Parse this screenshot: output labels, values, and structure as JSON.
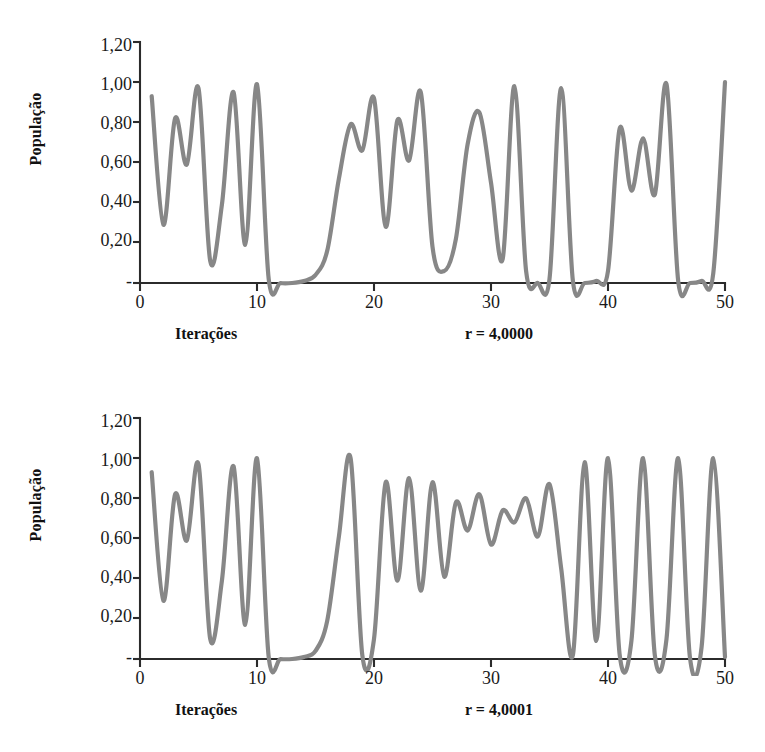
{
  "page": {
    "background_color": "#ffffff",
    "line_color": "#878787",
    "axis_color": "#2b2b2b"
  },
  "figures": [
    {
      "id": "figure-1",
      "ylabel": "População",
      "xlabel": "Iterações",
      "param_label": "r = 4,0000",
      "y_ticks": [
        "1,20",
        "1,00",
        "0,80",
        "0,60",
        "0,40",
        "0,20",
        "-"
      ],
      "x_ticks": [
        "0",
        "10",
        "20",
        "30",
        "40",
        "50"
      ]
    },
    {
      "id": "figure-2",
      "ylabel": "População",
      "xlabel": "Iterações",
      "param_label": "r = 4,0001",
      "y_ticks": [
        "1,20",
        "1,00",
        "0,80",
        "0,60",
        "0,40",
        "0,20",
        "-"
      ],
      "x_ticks": [
        "0",
        "10",
        "20",
        "30",
        "40",
        "50"
      ]
    }
  ],
  "chart_data": [
    {
      "type": "line",
      "title": "",
      "subtitle": "",
      "xlabel": "Iterações",
      "ylabel": "População",
      "annotation": "r = 4,0000",
      "xlim": [
        0,
        50
      ],
      "ylim": [
        0,
        1.2
      ],
      "yticks": [
        0,
        0.2,
        0.4,
        0.6,
        0.8,
        1.0,
        1.2
      ],
      "ytick_labels": [
        "-",
        "0,20",
        "0,40",
        "0,60",
        "0,80",
        "1,00",
        "1,20"
      ],
      "xticks": [
        0,
        10,
        20,
        30,
        40,
        50
      ],
      "xtick_labels": [
        "0",
        "10",
        "20",
        "30",
        "40",
        "50"
      ],
      "grid": false,
      "legend": false,
      "series": [
        {
          "name": "r = 4,0000",
          "x": [
            1,
            2,
            3,
            4,
            5,
            6,
            7,
            8,
            9,
            10,
            11,
            12,
            13,
            14,
            15,
            16,
            17,
            18,
            19,
            20,
            21,
            22,
            23,
            24,
            25,
            26,
            27,
            28,
            29,
            30,
            31,
            32,
            33,
            34,
            35,
            36,
            37,
            38,
            39,
            40,
            41,
            42,
            43,
            44,
            45,
            46,
            47,
            48,
            49,
            50
          ],
          "values": [
            0.93,
            0.29,
            0.82,
            0.59,
            0.97,
            0.11,
            0.39,
            0.95,
            0.19,
            0.99,
            0.02,
            0.0,
            0.0,
            0.01,
            0.04,
            0.16,
            0.52,
            0.79,
            0.66,
            0.92,
            0.28,
            0.81,
            0.61,
            0.95,
            0.18,
            0.06,
            0.22,
            0.69,
            0.85,
            0.5,
            0.12,
            0.98,
            0.06,
            0.0,
            0.02,
            0.97,
            0.01,
            0.0,
            0.01,
            0.06,
            0.77,
            0.46,
            0.72,
            0.44,
            0.99,
            0.01,
            0.0,
            0.01,
            0.05,
            1.0
          ]
        }
      ]
    },
    {
      "type": "line",
      "title": "",
      "subtitle": "",
      "xlabel": "Iterações",
      "ylabel": "População",
      "annotation": "r = 4,0001",
      "xlim": [
        0,
        50
      ],
      "ylim": [
        0,
        1.2
      ],
      "yticks": [
        0,
        0.2,
        0.4,
        0.6,
        0.8,
        1.0,
        1.2
      ],
      "ytick_labels": [
        "-",
        "0,20",
        "0,40",
        "0,60",
        "0,80",
        "1,00",
        "1,20"
      ],
      "xticks": [
        0,
        10,
        20,
        30,
        40,
        50
      ],
      "xtick_labels": [
        "0",
        "10",
        "20",
        "30",
        "40",
        "50"
      ],
      "grid": false,
      "legend": false,
      "series": [
        {
          "name": "r = 4,0001",
          "x": [
            1,
            2,
            3,
            4,
            5,
            6,
            7,
            8,
            9,
            10,
            11,
            12,
            13,
            14,
            15,
            16,
            17,
            18,
            19,
            20,
            21,
            22,
            23,
            24,
            25,
            26,
            27,
            28,
            29,
            30,
            31,
            32,
            33,
            34,
            35,
            36,
            37,
            38,
            39,
            40,
            41,
            42,
            43,
            44,
            45,
            46,
            47,
            48,
            49,
            50
          ],
          "values": [
            0.93,
            0.29,
            0.82,
            0.59,
            0.97,
            0.1,
            0.39,
            0.96,
            0.17,
            1.0,
            0.01,
            0.0,
            0.0,
            0.01,
            0.04,
            0.19,
            0.61,
            1.0,
            0.02,
            0.1,
            0.88,
            0.39,
            0.9,
            0.34,
            0.88,
            0.41,
            0.78,
            0.64,
            0.82,
            0.57,
            0.74,
            0.68,
            0.8,
            0.61,
            0.87,
            0.45,
            0.02,
            0.98,
            0.09,
            1.0,
            0.02,
            0.09,
            1.0,
            0.02,
            0.1,
            1.0,
            0.01,
            0.06,
            1.0,
            0.01
          ]
        }
      ]
    }
  ]
}
